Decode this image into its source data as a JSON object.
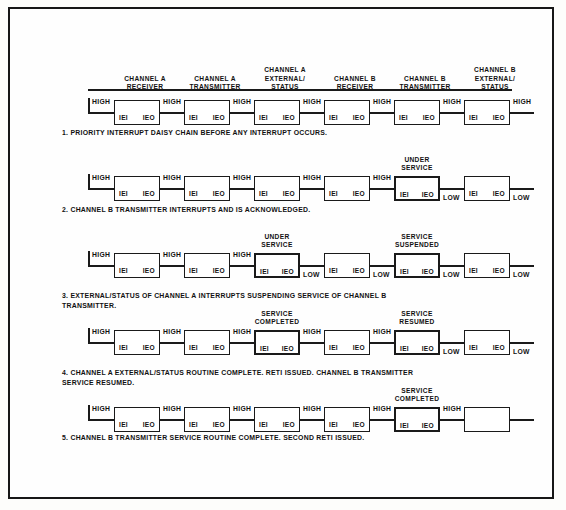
{
  "diagram": {
    "title": "Priority Interrupt Daisy Chain",
    "headers": [
      {
        "line1": "CHANNEL A",
        "line2": "RECEIVER",
        "line3": ""
      },
      {
        "line1": "CHANNEL A",
        "line2": "TRANSMITTER",
        "line3": ""
      },
      {
        "line1": "CHANNEL A",
        "line2": "EXTERNAL/",
        "line3": "STATUS"
      },
      {
        "line1": "CHANNEL B",
        "line2": "RECEIVER",
        "line3": ""
      },
      {
        "line1": "CHANNEL B",
        "line2": "TRANSMITTER",
        "line3": ""
      },
      {
        "line1": "CHANNEL B",
        "line2": "EXTERNAL/",
        "line3": "STATUS"
      }
    ],
    "box_labels": {
      "input": "IEI",
      "output": "IEO"
    },
    "levels": {
      "high": "HIGH",
      "low": "LOW"
    },
    "rows": [
      {
        "id": "row-1",
        "caption": "1.  PRIORITY INTERRUPT DAISY CHAIN BEFORE ANY INTERRUPT OCCURS.",
        "caption_line2": "",
        "lead_level": "HIGH",
        "boxes": [
          {
            "active": false,
            "empty": false,
            "state": [],
            "out_level": "HIGH"
          },
          {
            "active": false,
            "empty": false,
            "state": [],
            "out_level": "HIGH"
          },
          {
            "active": false,
            "empty": false,
            "state": [],
            "out_level": "HIGH"
          },
          {
            "active": false,
            "empty": false,
            "state": [],
            "out_level": "HIGH"
          },
          {
            "active": false,
            "empty": false,
            "state": [],
            "out_level": "HIGH"
          },
          {
            "active": false,
            "empty": false,
            "state": [],
            "out_level": "HIGH"
          }
        ]
      },
      {
        "id": "row-2",
        "caption": "2.  CHANNEL B TRANSMITTER INTERRUPTS AND IS ACKNOWLEDGED.",
        "caption_line2": "",
        "lead_level": "HIGH",
        "boxes": [
          {
            "active": false,
            "empty": false,
            "state": [],
            "out_level": "HIGH"
          },
          {
            "active": false,
            "empty": false,
            "state": [],
            "out_level": "HIGH"
          },
          {
            "active": false,
            "empty": false,
            "state": [],
            "out_level": "HIGH"
          },
          {
            "active": false,
            "empty": false,
            "state": [],
            "out_level": "HIGH"
          },
          {
            "active": true,
            "empty": false,
            "state": [
              "UNDER",
              "SERVICE"
            ],
            "out_level": "LOW"
          },
          {
            "active": false,
            "empty": false,
            "state": [],
            "out_level": "LOW"
          }
        ]
      },
      {
        "id": "row-3",
        "caption": "3.  EXTERNAL/STATUS  OF  CHANNEL  A  INTERRUPTS  SUSPENDING  SERVICE  OF  CHANNEL  B",
        "caption_line2": "TRANSMITTER.",
        "lead_level": "HIGH",
        "boxes": [
          {
            "active": false,
            "empty": false,
            "state": [],
            "out_level": "HIGH"
          },
          {
            "active": false,
            "empty": false,
            "state": [],
            "out_level": "HIGH"
          },
          {
            "active": true,
            "empty": false,
            "state": [
              "UNDER",
              "SERVICE"
            ],
            "out_level": "LOW"
          },
          {
            "active": false,
            "empty": false,
            "state": [],
            "out_level": "LOW"
          },
          {
            "active": true,
            "empty": false,
            "state": [
              "SERVICE",
              "SUSPENDED"
            ],
            "out_level": "LOW"
          },
          {
            "active": false,
            "empty": false,
            "state": [],
            "out_level": "LOW"
          }
        ]
      },
      {
        "id": "row-4",
        "caption": "4.  CHANNEL A EXTERNAL/STATUS ROUTINE COMPLETE. RETI ISSUED. CHANNEL B TRANSMITTER",
        "caption_line2": "SERVICE RESUMED.",
        "lead_level": "HIGH",
        "boxes": [
          {
            "active": false,
            "empty": false,
            "state": [],
            "out_level": "HIGH"
          },
          {
            "active": false,
            "empty": false,
            "state": [],
            "out_level": "HIGH"
          },
          {
            "active": true,
            "empty": false,
            "state": [
              "SERVICE",
              "COMPLETED"
            ],
            "out_level": "HIGH"
          },
          {
            "active": false,
            "empty": false,
            "state": [],
            "out_level": "HIGH"
          },
          {
            "active": true,
            "empty": false,
            "state": [
              "SERVICE",
              "RESUMED"
            ],
            "out_level": "LOW"
          },
          {
            "active": false,
            "empty": false,
            "state": [],
            "out_level": "LOW"
          }
        ]
      },
      {
        "id": "row-5",
        "caption": "5.  CHANNEL B TRANSMITTER SERVICE ROUTINE COMPLETE. SECOND RETI ISSUED.",
        "caption_line2": "",
        "lead_level": "HIGH",
        "boxes": [
          {
            "active": false,
            "empty": false,
            "state": [],
            "out_level": "HIGH"
          },
          {
            "active": false,
            "empty": false,
            "state": [],
            "out_level": "HIGH"
          },
          {
            "active": false,
            "empty": false,
            "state": [],
            "out_level": "HIGH"
          },
          {
            "active": false,
            "empty": false,
            "state": [],
            "out_level": "HIGH"
          },
          {
            "active": true,
            "empty": false,
            "state": [
              "SERVICE",
              "COMPLETED"
            ],
            "out_level": "HIGH"
          },
          {
            "active": false,
            "empty": true,
            "state": [],
            "out_level": ""
          }
        ]
      }
    ]
  },
  "colors": {
    "ink": "#1a1a1a",
    "paper": "#fefefe",
    "page": "#fdfdfb"
  }
}
